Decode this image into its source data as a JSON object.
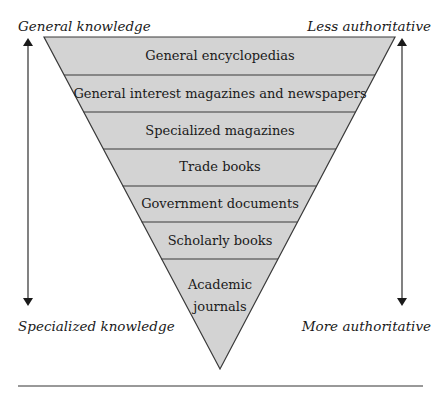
{
  "corners": {
    "top_left": "General knowledge",
    "top_right": "Less authoritative",
    "bottom_left": "Specialized knowledge",
    "bottom_right": "More authoritative"
  },
  "pyramid": {
    "fill_color": "#d3d3d3",
    "line_color": "#3a3a3a",
    "bands": [
      {
        "label": "General encyclopedias"
      },
      {
        "label": "General interest magazines and newspapers"
      },
      {
        "label": "Specialized magazines"
      },
      {
        "label": "Trade books"
      },
      {
        "label": "Government documents"
      },
      {
        "label": "Scholarly books"
      },
      {
        "label": "Academic journals"
      }
    ]
  }
}
